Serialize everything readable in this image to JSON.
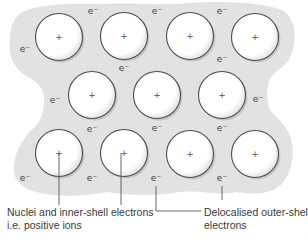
{
  "diagram": {
    "colors": {
      "sea": "#e2e2e2",
      "ion_fill": "#ffffff",
      "ion_stroke": "#4a4a4a",
      "ion_shadow": "#c4c4c4",
      "line": "#555555",
      "text": "#3a3a3a"
    },
    "ion_symbol": "+",
    "electron_symbol": "e⁻",
    "ions": [
      {
        "row": 1,
        "x": 59,
        "y": 37
      },
      {
        "row": 1,
        "x": 124,
        "y": 36
      },
      {
        "row": 1,
        "x": 190,
        "y": 36
      },
      {
        "row": 1,
        "x": 255,
        "y": 37
      },
      {
        "row": 2,
        "x": 92,
        "y": 95
      },
      {
        "row": 2,
        "x": 157,
        "y": 95
      },
      {
        "row": 2,
        "x": 222,
        "y": 95
      },
      {
        "row": 3,
        "x": 59,
        "y": 153
      },
      {
        "row": 3,
        "x": 124,
        "y": 153
      },
      {
        "row": 3,
        "x": 190,
        "y": 154
      },
      {
        "row": 3,
        "x": 255,
        "y": 154
      }
    ],
    "electrons": [
      {
        "x": 93,
        "y": 14
      },
      {
        "x": 157,
        "y": 14
      },
      {
        "x": 222,
        "y": 14
      },
      {
        "x": 25,
        "y": 52
      },
      {
        "x": 124,
        "y": 71
      },
      {
        "x": 222,
        "y": 62
      },
      {
        "x": 55,
        "y": 103
      },
      {
        "x": 258,
        "y": 102
      },
      {
        "x": 92,
        "y": 132
      },
      {
        "x": 157,
        "y": 131
      },
      {
        "x": 222,
        "y": 131
      },
      {
        "x": 25,
        "y": 181
      },
      {
        "x": 92,
        "y": 181
      },
      {
        "x": 156,
        "y": 181
      },
      {
        "x": 222,
        "y": 181
      }
    ],
    "labels": {
      "ions_label_line1": "Nuclei and inner-shell electrons",
      "ions_label_line2": "i.e. positive ions",
      "electrons_label_line1": "Delocalised outer-shell",
      "electrons_label_line2": "electrons"
    }
  }
}
